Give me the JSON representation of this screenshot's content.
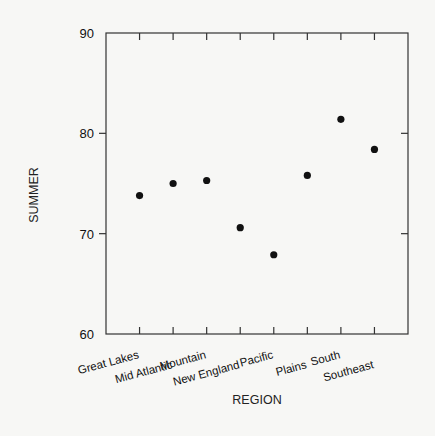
{
  "chart_data": {
    "type": "scatter",
    "title": "",
    "xlabel": "REGION",
    "ylabel": "SUMMER",
    "categories": [
      "Great Lakes",
      "Mid Atlantic",
      "Mountain",
      "New England",
      "Pacific",
      "Plains",
      "South",
      "Southeast"
    ],
    "values": [
      73.8,
      75.0,
      75.3,
      70.6,
      67.9,
      75.8,
      81.4,
      78.4
    ],
    "ylim": [
      60,
      90
    ],
    "yticks": [
      60,
      70,
      80,
      90
    ],
    "ytick_labels": [
      "60",
      "70",
      "80",
      "90"
    ],
    "grid": false,
    "legend": "none",
    "marker_color": "#111111",
    "axis_color": "#333333"
  }
}
